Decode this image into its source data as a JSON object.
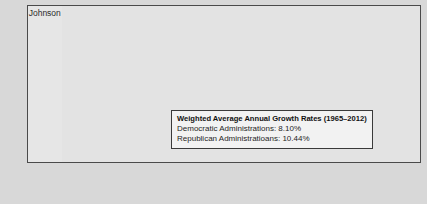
{
  "chart_data": {
    "type": "line",
    "title": "",
    "xlabel": "",
    "ylabel": "",
    "ylim": [
      3.0,
      8.5
    ],
    "xlim": [
      1965,
      2012
    ],
    "grid": true,
    "legend_position": "inside-center-right",
    "y_ticks": [
      "8.5",
      "8.0",
      "7.5",
      "7.0",
      "6.5",
      "6.0",
      "5.5",
      "5.0",
      "4.5",
      "4.0",
      "3.5",
      "3.0"
    ],
    "x_ticks": [
      "1965",
      "1967",
      "1969",
      "1971",
      "1973",
      "1975",
      "1977",
      "1979",
      "1981",
      "1983",
      "1985",
      "1987",
      "1989",
      "1991",
      "1993",
      "1995",
      "1997",
      "1999",
      "2001",
      "2003",
      "2005",
      "2007",
      "2009",
      "2011"
    ],
    "x_tick_years": [
      1965,
      1967,
      1969,
      1971,
      1973,
      1975,
      1977,
      1979,
      1981,
      1983,
      1985,
      1987,
      1989,
      1991,
      1993,
      1995,
      1997,
      1999,
      2001,
      2003,
      2005,
      2007,
      2009,
      2011
    ],
    "series": [
      {
        "name": "Log of series",
        "color": "#1a1a1a",
        "x": [
          1965,
          1966,
          1967,
          1968,
          1969,
          1970,
          1971,
          1972,
          1973,
          1974,
          1975,
          1976,
          1977,
          1978,
          1979,
          1980,
          1981,
          1982,
          1983,
          1984,
          1985,
          1986,
          1987,
          1988,
          1989,
          1990,
          1991,
          1992,
          1993,
          1994,
          1995,
          1996,
          1997,
          1998,
          1999,
          2000,
          2001,
          2002,
          2003,
          2004,
          2005,
          2006,
          2007,
          2008,
          2009,
          2010,
          2011,
          2012
        ],
        "values": [
          3.52,
          3.6,
          3.7,
          3.82,
          3.94,
          4.05,
          4.18,
          4.3,
          4.42,
          4.55,
          4.72,
          4.83,
          4.93,
          5.02,
          5.1,
          5.18,
          5.26,
          5.34,
          5.42,
          5.5,
          5.57,
          5.64,
          5.7,
          5.76,
          5.82,
          5.88,
          5.96,
          6.0,
          6.05,
          6.1,
          6.16,
          6.22,
          6.28,
          6.34,
          6.41,
          6.49,
          6.56,
          6.63,
          6.7,
          6.78,
          6.86,
          6.94,
          7.02,
          7.1,
          7.22,
          7.34,
          7.4,
          7.42
        ]
      }
    ],
    "bands": [
      {
        "label": "Johnson",
        "start": 1965,
        "end": 1969,
        "shade": "light",
        "party": "D",
        "growth_label": "14.2%"
      },
      {
        "label": "Nixon",
        "start": 1969,
        "end": 1975,
        "shade": "dark",
        "party": "R",
        "growth_label": "15.8%"
      },
      {
        "label": "Ford",
        "start": 1975,
        "end": 1977,
        "shade": "light",
        "party": "R",
        "growth_label": "17.4%"
      },
      {
        "label": "Carter",
        "start": 1977,
        "end": 1981,
        "shade": "dark",
        "party": "D",
        "growth_label": "11.2%"
      },
      {
        "label": "Reagan",
        "start": 1981,
        "end": 1989,
        "shade": "light",
        "party": "R",
        "growth_label": "7.3%"
      },
      {
        "label": "Bush",
        "start": 1989,
        "end": 1993,
        "shade": "dark",
        "party": "R",
        "growth_label": "11.3%"
      },
      {
        "label": "Clinton",
        "start": 1993,
        "end": 2001,
        "shade": "light",
        "party": "D",
        "growth_label": "4.5%"
      },
      {
        "label": "Bush",
        "start": 2001,
        "end": 2009,
        "shade": "dark",
        "party": "R",
        "growth_label": "7.4%"
      },
      {
        "label": "Obama",
        "start": 2009,
        "end": 2012,
        "shade": "light",
        "party": "D",
        "growth_label": "6.0%"
      }
    ],
    "annotations": [
      "14.2%",
      "15.8%",
      "17.4%",
      "11.2%",
      "7.3%",
      "11.3%",
      "4.5%",
      "7.4%",
      "6.0%"
    ]
  },
  "legend": {
    "title": "Weighted Average Annual Growth Rates (1965–2012)",
    "democratic": "Democratic Administrations: 8.10%",
    "republican": "Republican Administratioans: 10.44%"
  },
  "colors": {
    "line": "#1a1a1a",
    "band_dark": "#c9c9c9",
    "band_light": "#e6e6e6",
    "plot_bg": "#e3e3e3",
    "page_bg": "#d8d8d8",
    "axis": "#3a3a3a",
    "legend_bg": "#f2f2f2"
  }
}
